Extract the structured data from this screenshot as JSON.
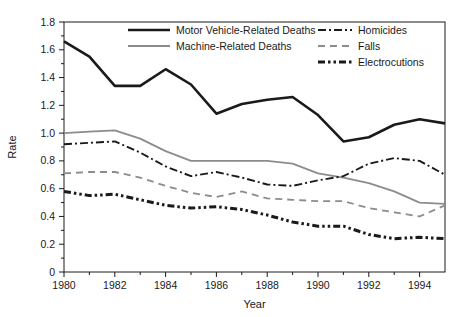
{
  "chart_data": {
    "type": "line",
    "title": "",
    "xlabel": "Year",
    "ylabel": "Rate",
    "xlim": [
      1980,
      1995
    ],
    "ylim": [
      0,
      1.8
    ],
    "grid": false,
    "legend_position": "top-inside",
    "x": [
      1980,
      1981,
      1982,
      1983,
      1984,
      1985,
      1986,
      1987,
      1988,
      1989,
      1990,
      1991,
      1992,
      1993,
      1994,
      1995
    ],
    "xticks": [
      "1980",
      "1982",
      "1984",
      "1986",
      "1988",
      "1990",
      "1992",
      "1994"
    ],
    "xtick_values": [
      1980,
      1982,
      1984,
      1986,
      1988,
      1990,
      1992,
      1994
    ],
    "yticks": [
      "0",
      "0.2",
      "0.4",
      "0.6",
      "0.8",
      "1.0",
      "1.2",
      "1.4",
      "1.6",
      "1.8"
    ],
    "ytick_values": [
      0,
      0.2,
      0.4,
      0.6,
      0.8,
      1.0,
      1.2,
      1.4,
      1.6,
      1.8
    ],
    "yminor_step": 0.1,
    "series": [
      {
        "name": "Motor Vehicle-Related Deaths",
        "style": "solid",
        "color": "#1a1a1a",
        "width": 2.6,
        "values": [
          1.66,
          1.55,
          1.34,
          1.34,
          1.46,
          1.35,
          1.14,
          1.21,
          1.24,
          1.26,
          1.13,
          0.94,
          0.97,
          1.06,
          1.1,
          1.07
        ]
      },
      {
        "name": "Machine-Related Deaths",
        "style": "solid",
        "color": "#8c8c8c",
        "width": 1.8,
        "values": [
          1.0,
          1.01,
          1.02,
          0.96,
          0.87,
          0.8,
          0.8,
          0.8,
          0.8,
          0.78,
          0.71,
          0.68,
          0.64,
          0.58,
          0.5,
          0.49
        ]
      },
      {
        "name": "Homicides",
        "style": "dashdot",
        "color": "#1a1a1a",
        "width": 1.9,
        "values": [
          0.92,
          0.93,
          0.94,
          0.86,
          0.76,
          0.69,
          0.72,
          0.68,
          0.63,
          0.62,
          0.66,
          0.69,
          0.78,
          0.82,
          0.8,
          0.7
        ]
      },
      {
        "name": "Falls",
        "style": "dashed",
        "color": "#8c8c8c",
        "width": 1.8,
        "values": [
          0.71,
          0.72,
          0.72,
          0.68,
          0.62,
          0.57,
          0.54,
          0.58,
          0.53,
          0.52,
          0.51,
          0.51,
          0.46,
          0.43,
          0.4,
          0.48
        ]
      },
      {
        "name": "Electrocutions",
        "style": "dashdotdot",
        "color": "#1a1a1a",
        "width": 3.0,
        "values": [
          0.58,
          0.55,
          0.56,
          0.52,
          0.48,
          0.46,
          0.47,
          0.45,
          0.41,
          0.36,
          0.33,
          0.33,
          0.27,
          0.24,
          0.25,
          0.24
        ]
      }
    ],
    "legend": [
      {
        "label": "Motor Vehicle-Related Deaths",
        "style": "solid",
        "color": "#1a1a1a",
        "width": 2.6
      },
      {
        "label": "Machine-Related Deaths",
        "style": "solid",
        "color": "#8c8c8c",
        "width": 1.8
      },
      {
        "label": "Homicides",
        "style": "dashdot",
        "color": "#1a1a1a",
        "width": 1.9
      },
      {
        "label": "Falls",
        "style": "dashed",
        "color": "#8c8c8c",
        "width": 1.8
      },
      {
        "label": "Electrocutions",
        "style": "dashdotdot",
        "color": "#1a1a1a",
        "width": 3.0
      }
    ]
  }
}
